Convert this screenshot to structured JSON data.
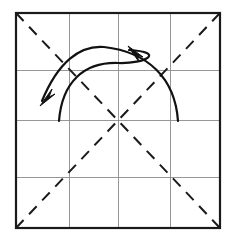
{
  "figure": {
    "title": "Origami folding step diagram",
    "description": "Square sheet with a four-by-four grid of creases, both dashed diagonals, and two curved fold arrows",
    "background_color": "#ffffff"
  },
  "colors": {
    "outline": "#1a1a1a",
    "grid": "#8c8c8c",
    "crease_dashed": "#1a1a1a",
    "arrow": "#111111",
    "paper_fill": "#ffffff"
  },
  "paper": {
    "label": "paper-square",
    "x": 16,
    "y": 13,
    "width": 204,
    "height": 215,
    "stroke_width": 2.2
  },
  "grid": {
    "label": "crease-grid",
    "divisions": 4,
    "stroke_width": 0.9,
    "vertical_x": [
      69,
      118,
      170
    ],
    "horizontal_y": [
      70,
      120,
      177
    ]
  },
  "diagonals": [
    {
      "name": "diagonal-tl-br",
      "x1": 16,
      "y1": 13,
      "x2": 220,
      "y2": 228,
      "style": "dashed",
      "dash": "11 8",
      "stroke_width": 2.0
    },
    {
      "name": "diagonal-bl-tr",
      "x1": 16,
      "y1": 228,
      "x2": 220,
      "y2": 13,
      "style": "dashed",
      "dash": "11 8",
      "stroke_width": 2.0
    }
  ],
  "arrows": [
    {
      "name": "fold-arrow-right-to-left",
      "direction": "right-to-left",
      "path": "M 178 121 C 175 78 148 52 104 47 C 80 45 58 62 42 101",
      "head_x": 40,
      "head_y": 106,
      "head_angle": 245,
      "stroke_width": 2.2
    },
    {
      "name": "fold-arrow-left-to-right",
      "direction": "left-to-right",
      "path": "M 59 121 C 62 82 84 62 118 63 C 146 64 166 52 129 50",
      "head_x": 128,
      "head_y": 46,
      "head_angle": 300,
      "stroke_width": 2.2
    }
  ],
  "arrowheads": [
    {
      "name": "arrowhead-lower-left",
      "points": "40,106 55,94 49,97 52,89",
      "tip_x": 40,
      "tip_y": 106
    },
    {
      "name": "arrowhead-upper-center",
      "points": "128,46 143,57 137,55 139,62",
      "tip_x": 128,
      "tip_y": 46
    }
  ],
  "legend": {
    "dashed_meaning": "valley / mountain crease line",
    "solid_meaning": "paper edge",
    "arrow_meaning": "fold direction"
  }
}
